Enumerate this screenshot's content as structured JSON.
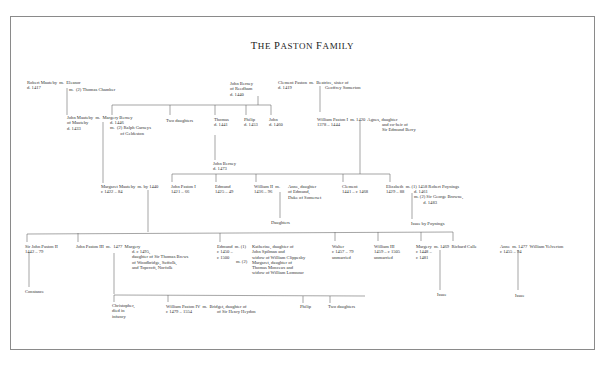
{
  "title": "The Paston Family",
  "nodes": {
    "robert_mauteby": "Robert Mauteby  m.  Eleanor\nd. 1417",
    "eleanor_m2": "m.  (2) Thomas Chamber",
    "john_berney_reedham": "John Berney\nof Reedham\nd. 1440",
    "clement_paston": "Clement Paston  m.  Beatrice, sister of\nd. 1419",
    "geoffrey_somerton": "Geoffrey Somerton",
    "john_mauteby": "John Mauteby  m.  Margery Berney\nof Mauteby\nd. 1433",
    "margery_berney_detail": "d. 1446\nm.  (2) Ralph Garneys\n         of Geldeston",
    "two_daughters_berney": "Two daughters",
    "thomas": "Thomas\nd. 1441",
    "philip_berney": "Philip\nd. 1453",
    "john_berney_1460": "John\nd. 1460",
    "william_paston_i": "William Paston I  m. 1420  Agnes, daughter\n1378 – 1444",
    "agnes_detail": "and co-heir of\nSir Edmund Berry",
    "john_berney_1473": "John Berney\nd. 1473",
    "margaret_mauteby": "Margaret Mauteby  m. by 1440\nc 1422 – 84",
    "john_paston_i": "John Paston I\n1421 – 66",
    "edmund_1425": "Edmund\n1425 – 49",
    "william_ii": "William II  m.\n1436 – 96",
    "anne_somerset": "Anne, daughter\nof Edmund,\nDuke of Somerset",
    "daughters_william_ii": "Daughters",
    "clement_1441": "Clement\n1441 – c 1468",
    "elizabeth": "Elizabeth  m. (1) 1458 Robert Poynings\n1429 – 88",
    "elizabeth_detail": "d. 1461\nm. (2) Sir George Browne,\n        d. 1483",
    "issue_poynings": "Issue by Poynings",
    "sir_john_paston_ii": "Sir John Paston II\n1442 – 79",
    "john_paston_iii": "John Paston III  m.  1477  Margery",
    "margery_brews": "d. c 1495,\ndaughter of Sir Thomas Brews\nof Woodbridge, Suffolk,\nand Topcroft, Norfolk",
    "edmund_1450": "Edmund  m. (1)\nc 1450 –\nc 1500",
    "edmund_wives": "Katherine, daughter of\nJohn Spilman and\nwidow of William Clippesby\nMargaret, daughter of\nThomas Monceux and\nwidow of William Lomnour",
    "edmund_m2": "m. (2)",
    "walter": "Walter\nc 1457 – 79\nunmarried",
    "william_iii": "William III\n1459 – c 1505\nunmarried",
    "margery_calle": "Margery  m. 1469  Richard Calle\nc 1448 –\nc 1481",
    "anne_yelverton": "Anne  m. 1477  William Yelverton\nc 1455 – 94",
    "constance": "Constance",
    "christopher": "Christopher,\ndied in\ninfancy",
    "william_paston_iv": "William Paston IV  m.  Bridget, daughter of\nc 1479 – 1554",
    "bridget_detail": "of Sir Henry Heydon",
    "philip_iv": "Philip",
    "two_daughters_iii": "Two daughters",
    "issue_calle": "Issue",
    "issue_yelverton": "Issue"
  }
}
